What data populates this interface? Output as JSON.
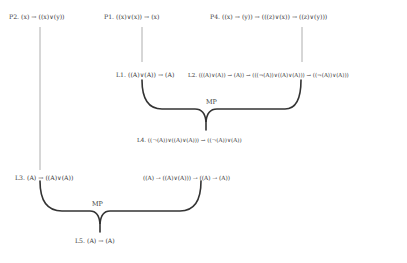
{
  "nodes": {
    "p2": "P2. (x) → ((x)∨(y))",
    "p1": "P1. ((x)∨(x)) → (x)",
    "p4": "P4. ((x) → (y)) → (((z)∨(x)) → ((z)∨(y)))",
    "l1": "L1. ((A)∨(A)) → (A)",
    "l2": "L2. (((A)∨(A)) → (A)) → (((¬(A))∨((A)∨(A))) → ((¬(A))∨(A)))",
    "l4": "L4. ((¬(A))∨((A)∨(A))) → ((¬(A))∨(A))",
    "l3": "L3. (A) → ((A)∨(A))",
    "mid": "((A) → ((A)∨(A))) → ((A) → (A))",
    "l5": "L5. (A) → (A)"
  },
  "rules": {
    "mp1": "MP",
    "mp2": "MP"
  }
}
